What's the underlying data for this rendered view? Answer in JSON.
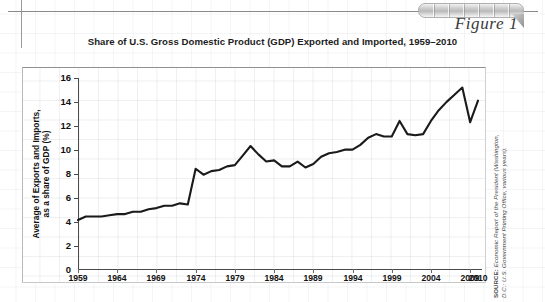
{
  "figure": {
    "label": "Figure 1",
    "title": "Share of U.S. Gross Domestic Product (GDP) Exported and Imported, 1959–2010",
    "source_prefix": "SOURCE:",
    "source_line1": " Economic Report of the President (Washington,",
    "source_line2": "D.C.: U.S. Government Printing Office, various years)."
  },
  "colors": {
    "line": "#1a1a1a",
    "axis": "#4a4a4a",
    "grid": "#b4b9c3",
    "text": "#111111",
    "tab_light": "#f2f2f2",
    "tab_dark": "#b9b9b9"
  },
  "chart_data": {
    "type": "line",
    "title": "Share of U.S. Gross Domestic Product (GDP) Exported and Imported, 1959–2010",
    "xlabel": "",
    "ylabel": "Average of Exports and Imports, as a share of GDP (%)",
    "ylabel_line1": "Average of Exports and Imports,",
    "ylabel_line2": "as a share of GDP (%)",
    "xlim": [
      1959,
      2010
    ],
    "ylim": [
      0,
      16
    ],
    "yticks": [
      0,
      2,
      4,
      6,
      8,
      10,
      12,
      14,
      16
    ],
    "xticks": [
      1959,
      1964,
      1969,
      1974,
      1979,
      1984,
      1989,
      1994,
      1999,
      2004,
      2009,
      2010
    ],
    "grid": true,
    "legend": "none",
    "series": [
      {
        "name": "Average of exports and imports as a share of GDP",
        "x": [
          1959,
          1960,
          1961,
          1962,
          1963,
          1964,
          1965,
          1966,
          1967,
          1968,
          1969,
          1970,
          1971,
          1972,
          1973,
          1974,
          1975,
          1976,
          1977,
          1978,
          1979,
          1980,
          1981,
          1982,
          1983,
          1984,
          1985,
          1986,
          1987,
          1988,
          1989,
          1990,
          1991,
          1992,
          1993,
          1994,
          1995,
          1996,
          1997,
          1998,
          1999,
          2000,
          2001,
          2002,
          2003,
          2004,
          2005,
          2006,
          2007,
          2008,
          2009,
          2010
        ],
        "values": [
          4.1,
          4.4,
          4.4,
          4.4,
          4.5,
          4.6,
          4.6,
          4.8,
          4.8,
          5.0,
          5.1,
          5.3,
          5.3,
          5.5,
          5.4,
          8.4,
          7.9,
          8.2,
          8.3,
          8.6,
          8.7,
          9.5,
          10.3,
          9.6,
          9.0,
          9.1,
          8.6,
          8.6,
          9.0,
          8.5,
          8.8,
          9.4,
          9.7,
          9.8,
          10.0,
          10.0,
          10.4,
          11.0,
          11.3,
          11.1,
          11.1,
          12.4,
          11.3,
          11.2,
          11.3,
          12.4,
          13.3,
          14.0,
          14.6,
          15.2,
          12.3,
          14.1
        ]
      }
    ]
  }
}
